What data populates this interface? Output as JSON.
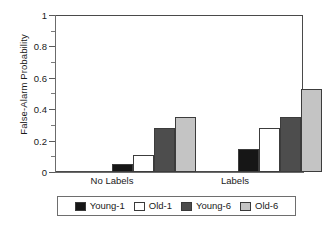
{
  "chart_data": {
    "type": "bar",
    "title": "",
    "xlabel": "",
    "ylabel": "False-Alarm Probability",
    "categories": [
      "No Labels",
      "Labels"
    ],
    "series": [
      {
        "name": "Young-1",
        "color": "#161616",
        "values": [
          0.05,
          0.15
        ]
      },
      {
        "name": "Old-1",
        "color": "#ffffff",
        "values": [
          0.11,
          0.28
        ]
      },
      {
        "name": "Young-6",
        "color": "#4d4d4d",
        "values": [
          0.285,
          0.355
        ]
      },
      {
        "name": "Old-6",
        "color": "#c4c4c4",
        "values": [
          0.355,
          0.53
        ]
      }
    ],
    "ylim": [
      0,
      1
    ],
    "yticks": [
      0,
      0.2,
      0.4,
      0.6,
      0.8,
      1
    ],
    "ytick_labels": [
      "0",
      "0.2",
      "0.4",
      "0.6",
      "0.8",
      "1"
    ],
    "yminor_ticks": [
      0.1,
      0.3,
      0.5,
      0.7,
      0.9
    ],
    "grid": false,
    "legend_position": "bottom"
  },
  "axis": {
    "y_title": "False-Alarm Probability",
    "tick_0": "0",
    "tick_1": "0.2",
    "tick_2": "0.4",
    "tick_3": "0.6",
    "tick_4": "0.8",
    "tick_5": "1"
  },
  "categories": {
    "group_1": "No Labels",
    "group_2": "Labels"
  },
  "legend": {
    "items": [
      {
        "label": "Young-1"
      },
      {
        "label": "Old-1"
      },
      {
        "label": "Young-6"
      },
      {
        "label": "Old-6"
      }
    ]
  }
}
